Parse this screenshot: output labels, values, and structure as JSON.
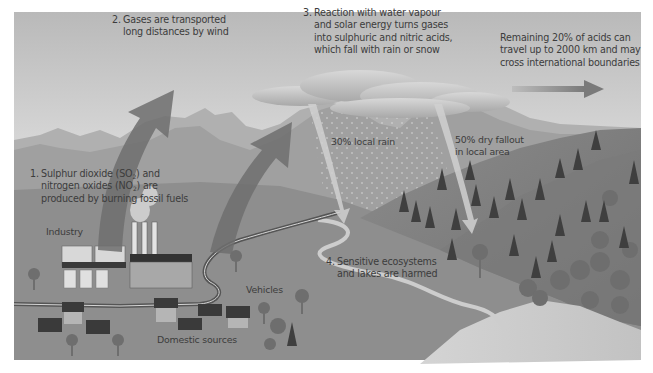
{
  "diagram": {
    "colors": {
      "sky_top": "#bdbdbd",
      "sky_bottom": "#e8e8e8",
      "mountain_far": "#a9a9a9",
      "mountain_near": "#8f8f8f",
      "ground": "#8a8a8a",
      "hill": "#7d7d7d",
      "river": "#c9c9c9",
      "arrow": "#6e6e6e",
      "cloud": "#c4c4c4",
      "text": "#3c3c3c"
    },
    "steps": [
      {
        "number": "1.",
        "lines": [
          "Sulphur dioxide (SO",
          "2",
          ") and",
          "nitrogen oxides (NO",
          "2",
          ") are",
          "produced by burning fossil fuels"
        ]
      },
      {
        "number": "2.",
        "lines": [
          "Gases are transported",
          "long distances by wind"
        ]
      },
      {
        "number": "3.",
        "lines": [
          "Reaction with water vapour",
          "and solar energy turns gases",
          "into sulphuric and nitric acids,",
          "which fall with rain or snow"
        ]
      },
      {
        "number": "4.",
        "lines": [
          "Sensitive ecosystems",
          "and lakes are harmed"
        ]
      }
    ],
    "remaining_note": {
      "lines": [
        "Remaining 20% of acids can",
        "travel up to 2000 km and may",
        "cross international boundaries"
      ]
    },
    "deposition": {
      "local_rain": {
        "percent": 30,
        "label": "30% local rain"
      },
      "dry_fallout": {
        "percent": 50,
        "lines": [
          "50% dry fallout",
          "in local area"
        ]
      },
      "long_range": {
        "percent": 20
      }
    },
    "source_labels": {
      "industry": "Industry",
      "vehicles": "Vehicles",
      "domestic": "Domestic sources"
    },
    "icons": [
      "upward-arrow-icon",
      "curved-rain-arrow-icon",
      "right-arrow-icon",
      "cloud-icon",
      "factory-icon",
      "house-icon",
      "tree-icon",
      "conifer-icon"
    ]
  }
}
